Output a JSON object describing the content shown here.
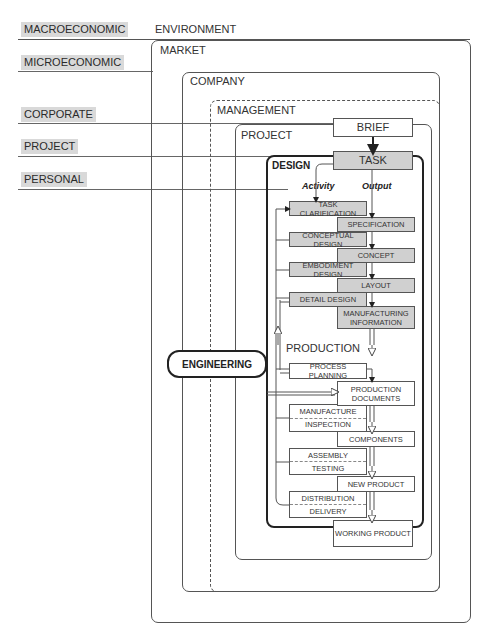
{
  "caption_fragment": "ppp yp yy",
  "levels": [
    {
      "label": "MACROECONOMIC",
      "context": "ENVIRONMENT"
    },
    {
      "label": "MICROECONOMIC",
      "context": "MARKET"
    },
    {
      "label": "CORPORATE",
      "context": "COMPANY"
    },
    {
      "label": "PROJECT",
      "context": "PROJECT"
    },
    {
      "label": "PERSONAL",
      "context": "DESIGN"
    }
  ],
  "frames": {
    "environment": "ENVIRONMENT",
    "market": "MARKET",
    "company": "COMPANY",
    "management": "MANAGEMENT",
    "project": "PROJECT",
    "design": "DESIGN",
    "production": "PRODUCTION"
  },
  "top_nodes": {
    "brief": "BRIEF",
    "task": "TASK"
  },
  "columns": {
    "activity": "Activity",
    "output": "Output"
  },
  "design_activities": [
    "TASK CLARIFICATION",
    "CONCEPTUAL DESIGN",
    "EMBODIMENT DESIGN",
    "DETAIL DESIGN"
  ],
  "design_outputs": [
    "SPECIFICATION",
    "CONCEPT",
    "LAYOUT",
    "MANUFACTURING INFORMATION"
  ],
  "production_activities": [
    {
      "top": "PROCESS PLANNING"
    },
    {
      "top": "MANUFACTURE",
      "bottom": "INSPECTION"
    },
    {
      "top": "ASSEMBLY",
      "bottom": "TESTING"
    },
    {
      "top": "DISTRIBUTION",
      "bottom": "DELIVERY"
    }
  ],
  "production_outputs": [
    "PRODUCTION DOCUMENTS",
    "COMPONENTS",
    "NEW PRODUCT",
    "WORKING PRODUCT"
  ],
  "engineering_label": "ENGINEERING",
  "colors": {
    "label_bg": "#d9d9d9",
    "grey_node": "#d0d0d0",
    "line": "#555555"
  }
}
